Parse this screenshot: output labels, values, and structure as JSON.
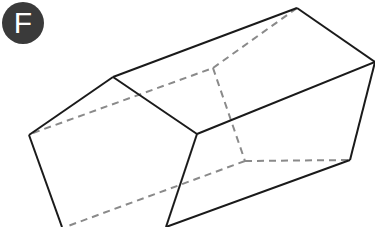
{
  "label": "F",
  "figure": {
    "type": "pentagonal-prism",
    "colors": {
      "edge": "#1a1a1a",
      "hidden_edge": "#8a8a8a",
      "badge": "#3a3a3a"
    }
  }
}
